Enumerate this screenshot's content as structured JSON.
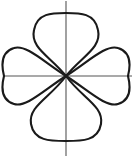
{
  "figure": {
    "background_color": "#ffffff",
    "width": 135,
    "height": 157,
    "caption": ""
  },
  "chart_data": {
    "type": "line",
    "subtype": "polar-rose",
    "title": "",
    "xlabel": "",
    "ylabel": "",
    "grid": false,
    "legend": null,
    "equation": "r = a*sin(2*theta)",
    "petal_count": 4,
    "center": {
      "x": 66,
      "y": 76
    },
    "axes": {
      "x_axis": {
        "x1": 3,
        "y1": 76,
        "x2": 132,
        "y2": 76,
        "color": "#555555"
      },
      "y_axis": {
        "x1": 66,
        "y1": 1,
        "x2": 66,
        "y2": 156,
        "color": "#555555"
      },
      "xlim": [
        -66,
        66
      ],
      "ylim": [
        -80,
        75
      ],
      "ticks": []
    },
    "curve": {
      "stroke_color": "#1a1a1a",
      "stroke_width": 2.1,
      "fill": "none"
    },
    "petals": [
      {
        "name": "top-petal",
        "direction": "up",
        "tip": {
          "x": 66,
          "y": 13
        },
        "max_half_width": 32,
        "extent_px": 63
      },
      {
        "name": "left-petal",
        "direction": "left",
        "tip": {
          "x": 4,
          "y": 76
        },
        "max_half_width": 28,
        "extent_px": 62
      },
      {
        "name": "right-petal",
        "direction": "right",
        "tip": {
          "x": 128,
          "y": 76
        },
        "max_half_width": 28,
        "extent_px": 62
      },
      {
        "name": "bottom-petal",
        "direction": "down",
        "tip": {
          "x": 66,
          "y": 141
        },
        "max_half_width": 33,
        "extent_px": 65
      }
    ],
    "paths": {
      "top": "M66,76 C50,56 30,48 34,30 C37,13 52,13 66,13 C80,13 95,13 98,30 C102,48 82,56 66,76 Z",
      "bottom": "M66,76 C50,98 28,106 31,124 C34,141 50,141 66,141 C82,141 98,141 101,124 C104,106 82,98 66,76 Z",
      "left": "M66,76 C44,62 26,44 14,48 C1,52 1,64 4,76 C1,88 1,100 14,104 C26,108 44,90 66,76 Z",
      "right": "M66,76 C88,62 106,44 118,48 C131,52 131,64 128,76 C131,88 131,100 118,104 C106,108 88,90 66,76 Z"
    }
  }
}
